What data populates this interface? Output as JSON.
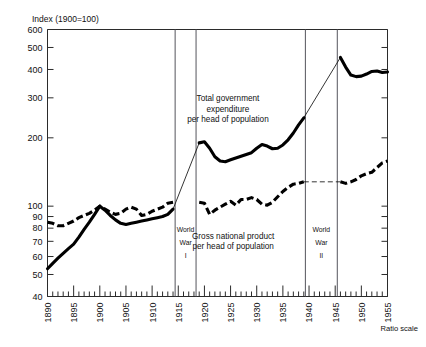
{
  "chart_data": {
    "type": "line",
    "title": "",
    "ylabel": "Index  (1900=100)",
    "xlabel": "",
    "scale_note": "Ratio scale",
    "yscale": "log",
    "ylim": [
      40,
      600
    ],
    "xlim": [
      1890,
      1955
    ],
    "yticks": [
      40,
      50,
      60,
      70,
      80,
      90,
      100,
      200,
      300,
      400,
      500,
      600
    ],
    "ytick_labels": [
      "40",
      "50",
      "60",
      "70",
      "80",
      "90",
      "100",
      "200",
      "300",
      "400",
      "500",
      "600"
    ],
    "xticks": [
      1890,
      1895,
      1900,
      1905,
      1910,
      1915,
      1920,
      1925,
      1930,
      1935,
      1940,
      1945,
      1950,
      1955
    ],
    "xtick_labels": [
      "1890",
      "1895",
      "1900",
      "1905",
      "1910",
      "1915",
      "1920",
      "1925",
      "1930",
      "1935",
      "1940",
      "1945",
      "1950",
      "1955"
    ],
    "grid": false,
    "legend_position": "inline-annotation",
    "series": [
      {
        "name": "Total government expenditure per head of population",
        "style": "solid",
        "segments": [
          {
            "label": "pre-war",
            "points": [
              [
                1890,
                53
              ],
              [
                1891,
                56
              ],
              [
                1892,
                59
              ],
              [
                1893,
                62
              ],
              [
                1894,
                65
              ],
              [
                1895,
                68
              ],
              [
                1896,
                73
              ],
              [
                1897,
                79
              ],
              [
                1898,
                85
              ],
              [
                1899,
                92
              ],
              [
                1900,
                100
              ],
              [
                1901,
                96
              ],
              [
                1902,
                91
              ],
              [
                1903,
                87
              ],
              [
                1904,
                84
              ],
              [
                1905,
                83
              ],
              [
                1906,
                84
              ],
              [
                1907,
                85
              ],
              [
                1908,
                86
              ],
              [
                1909,
                87
              ],
              [
                1910,
                88
              ],
              [
                1911,
                89
              ],
              [
                1912,
                90
              ],
              [
                1913,
                92
              ],
              [
                1914,
                97
              ]
            ]
          },
          {
            "label": "post-WWI",
            "points": [
              [
                1919,
                190
              ],
              [
                1920,
                192
              ],
              [
                1921,
                180
              ],
              [
                1922,
                165
              ],
              [
                1923,
                158
              ],
              [
                1924,
                157
              ],
              [
                1925,
                160
              ],
              [
                1926,
                163
              ],
              [
                1927,
                166
              ],
              [
                1928,
                169
              ],
              [
                1929,
                172
              ],
              [
                1930,
                180
              ],
              [
                1931,
                187
              ],
              [
                1932,
                184
              ],
              [
                1933,
                179
              ],
              [
                1934,
                180
              ],
              [
                1935,
                186
              ],
              [
                1936,
                196
              ],
              [
                1937,
                210
              ],
              [
                1938,
                228
              ],
              [
                1939,
                245
              ]
            ]
          },
          {
            "label": "post-WWII",
            "points": [
              [
                1946,
                452
              ],
              [
                1947,
                410
              ],
              [
                1948,
                378
              ],
              [
                1949,
                372
              ],
              [
                1950,
                374
              ],
              [
                1951,
                382
              ],
              [
                1952,
                392
              ],
              [
                1953,
                394
              ],
              [
                1954,
                388
              ],
              [
                1955,
                390
              ]
            ]
          }
        ],
        "bridges": [
          {
            "from": [
              1914,
              97
            ],
            "to": [
              1919,
              190
            ]
          },
          {
            "from": [
              1939,
              245
            ],
            "to": [
              1946,
              452
            ]
          }
        ]
      },
      {
        "name": "Gross national product per head of population",
        "style": "dashed",
        "segments": [
          {
            "label": "pre-war",
            "points": [
              [
                1890,
                85
              ],
              [
                1891,
                84
              ],
              [
                1892,
                82
              ],
              [
                1893,
                82
              ],
              [
                1894,
                84
              ],
              [
                1895,
                86
              ],
              [
                1896,
                89
              ],
              [
                1897,
                91
              ],
              [
                1898,
                93
              ],
              [
                1899,
                96
              ],
              [
                1900,
                100
              ],
              [
                1901,
                97
              ],
              [
                1902,
                94
              ],
              [
                1903,
                92
              ],
              [
                1904,
                93
              ],
              [
                1905,
                97
              ],
              [
                1906,
                99
              ],
              [
                1907,
                97
              ],
              [
                1908,
                91
              ],
              [
                1909,
                92
              ],
              [
                1910,
                95
              ],
              [
                1911,
                97
              ],
              [
                1912,
                99
              ],
              [
                1913,
                103
              ],
              [
                1914,
                104
              ]
            ]
          },
          {
            "label": "post-WWI",
            "points": [
              [
                1919,
                104
              ],
              [
                1920,
                103
              ],
              [
                1921,
                92
              ],
              [
                1922,
                96
              ],
              [
                1923,
                99
              ],
              [
                1924,
                102
              ],
              [
                1925,
                105
              ],
              [
                1926,
                101
              ],
              [
                1927,
                107
              ],
              [
                1928,
                107
              ],
              [
                1929,
                109
              ],
              [
                1930,
                107
              ],
              [
                1931,
                102
              ],
              [
                1932,
                101
              ],
              [
                1933,
                104
              ],
              [
                1934,
                110
              ],
              [
                1935,
                116
              ],
              [
                1936,
                121
              ],
              [
                1937,
                125
              ],
              [
                1938,
                126
              ],
              [
                1939,
                128
              ]
            ]
          },
          {
            "label": "post-WWII",
            "points": [
              [
                1946,
                128
              ],
              [
                1947,
                126
              ],
              [
                1948,
                128
              ],
              [
                1949,
                131
              ],
              [
                1950,
                136
              ],
              [
                1951,
                139
              ],
              [
                1952,
                141
              ],
              [
                1953,
                148
              ],
              [
                1954,
                155
              ],
              [
                1955,
                158
              ]
            ]
          }
        ],
        "bridges": [
          {
            "from": [
              1939,
              128
            ],
            "to": [
              1946,
              128
            ]
          }
        ]
      }
    ],
    "annotations": [
      {
        "id": "expenditure-label",
        "lines": [
          "Total government",
          "expenditure",
          "per head of population"
        ],
        "x": 1924.5,
        "y": 290
      },
      {
        "id": "gnp-label",
        "lines": [
          "Gross national product",
          "per head of population"
        ],
        "x": 1925.5,
        "y": 72
      }
    ],
    "war_bands": [
      {
        "id": "world-war-1",
        "lines": [
          "World",
          "War",
          "I"
        ],
        "start": 1914.4,
        "end": 1918.4
      },
      {
        "id": "world-war-2",
        "lines": [
          "World",
          "War",
          "II"
        ],
        "start": 1939.3,
        "end": 1945.4
      }
    ]
  }
}
